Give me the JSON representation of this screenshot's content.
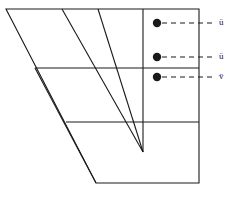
{
  "figure": {
    "type": "line-drawing",
    "background_color": "#ffffff",
    "stroke_color": "#1a1a1a",
    "marker_color": "#1a1a1a",
    "stroke_width": 1,
    "outline": {
      "name": "body-outline",
      "points": "6,9 199,9 199,183 96,183"
    },
    "interior_vertical_line": {
      "name": "axis-line",
      "x": 143,
      "y1": 9,
      "y2": 152
    },
    "converging_lines": [
      {
        "name": "converging-line-1",
        "x1": 62,
        "y1": 9,
        "x2": 143,
        "y2": 152
      },
      {
        "name": "converging-line-2",
        "x1": 98,
        "y1": 9,
        "x2": 143,
        "y2": 152
      }
    ],
    "divider_lines": [
      {
        "name": "divider-line-upper",
        "x1": 35,
        "y1": 68,
        "x2": 199,
        "y2": 68
      },
      {
        "name": "divider-line-lower",
        "x1": 66,
        "y1": 122,
        "x2": 199,
        "y2": 122
      }
    ],
    "left_inner_edge": {
      "name": "left-inner-edge",
      "x1": 35,
      "y1": 68,
      "x2": 96,
      "y2": 183
    },
    "annotations": [
      {
        "id": "annotation-upper",
        "label": "ü",
        "marker": {
          "cx": 157,
          "cy": 23,
          "r": 4.2
        },
        "leader": {
          "x1": 162,
          "y1": 23,
          "x2": 216,
          "y2": 23
        },
        "label_x": 219,
        "label_y": 18
      },
      {
        "id": "annotation-middle",
        "label": "ü",
        "marker": {
          "cx": 157,
          "cy": 57,
          "r": 4.2
        },
        "leader": {
          "x1": 162,
          "y1": 57,
          "x2": 216,
          "y2": 57
        },
        "label_x": 219,
        "label_y": 52
      },
      {
        "id": "annotation-lower",
        "label": "v̈",
        "marker": {
          "cx": 157,
          "cy": 77,
          "r": 4.2
        },
        "leader": {
          "x1": 162,
          "y1": 77,
          "x2": 216,
          "y2": 77
        },
        "label_x": 219,
        "label_y": 72
      }
    ]
  }
}
